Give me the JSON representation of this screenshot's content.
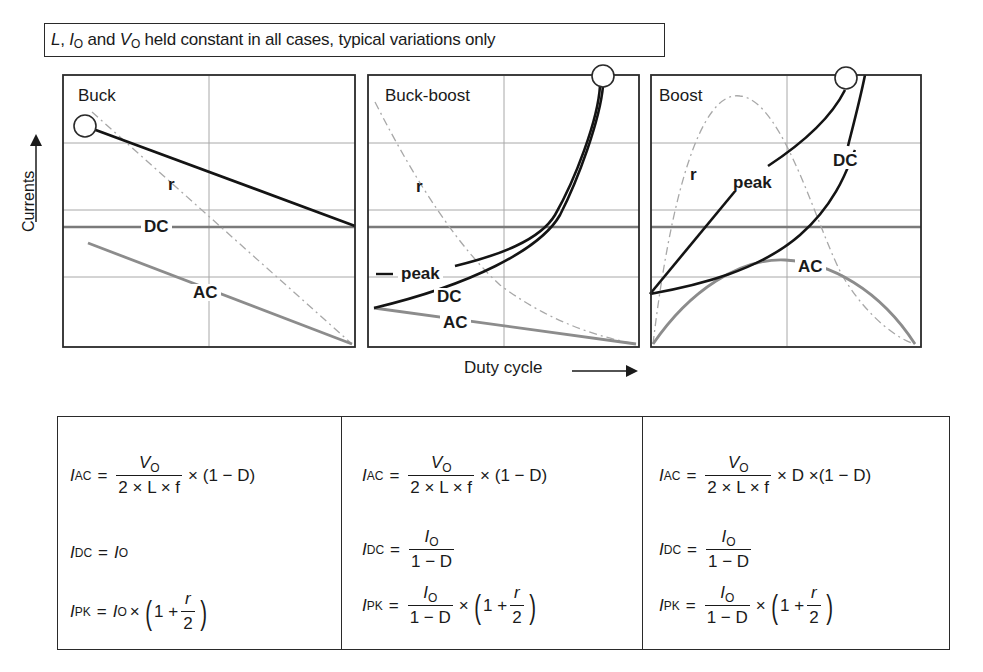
{
  "header": {
    "note_L": "L",
    "note_sep1": ", ",
    "note_I": "I",
    "note_I_sub": "O",
    "note_and": " and ",
    "note_V": "V",
    "note_V_sub": "O",
    "note_rest": " held constant in all cases, typical variations only"
  },
  "axes": {
    "y_label": "Currents",
    "x_label": "Duty cycle",
    "y_arrow_icon": "arrow-up",
    "x_arrow_icon": "arrow-right"
  },
  "panels": [
    {
      "title": "Buck",
      "labels": {
        "r": "r",
        "dc": "DC",
        "ac": "AC"
      }
    },
    {
      "title": "Buck-boost",
      "labels": {
        "r": "r",
        "peak": "peak",
        "dc": "DC",
        "ac": "AC"
      }
    },
    {
      "title": "Boost",
      "labels": {
        "r": "r",
        "peak": "peak",
        "dc": "DC",
        "ac": "AC"
      }
    }
  ],
  "formulas": [
    {
      "converter": "Buck",
      "i_ac": {
        "lhs": "I",
        "lhs_sub": "AC",
        "num": "V",
        "num_sub": "O",
        "den": "2 × L × f",
        "tail": "× (1 − D)"
      },
      "i_dc": {
        "lhs": "I",
        "lhs_sub": "DC",
        "rhs": "I",
        "rhs_sub": "O"
      },
      "i_pk": {
        "lhs": "I",
        "lhs_sub": "PK",
        "rhs": "I",
        "rhs_sub": "O",
        "mult": "×",
        "paren_inner": "1 +",
        "r": "r",
        "two": "2"
      }
    },
    {
      "converter": "Buck-boost",
      "i_ac": {
        "lhs": "I",
        "lhs_sub": "AC",
        "num": "V",
        "num_sub": "O",
        "den": "2 × L × f",
        "tail": "× (1 − D)"
      },
      "i_dc": {
        "lhs": "I",
        "lhs_sub": "DC",
        "num": "I",
        "num_sub": "O",
        "den": "1 − D"
      },
      "i_pk": {
        "lhs": "I",
        "lhs_sub": "PK",
        "num": "I",
        "num_sub": "O",
        "den": "1 − D",
        "mult": "×",
        "paren_inner": "1 +",
        "r": "r",
        "two": "2"
      }
    },
    {
      "converter": "Boost",
      "i_ac": {
        "lhs": "I",
        "lhs_sub": "AC",
        "num": "V",
        "num_sub": "O",
        "den": "2 × L × f",
        "tail": "× D ×(1 − D)"
      },
      "i_dc": {
        "lhs": "I",
        "lhs_sub": "DC",
        "num": "I",
        "num_sub": "O",
        "den": "1 − D"
      },
      "i_pk": {
        "lhs": "I",
        "lhs_sub": "PK",
        "num": "I",
        "num_sub": "O",
        "den": "1 − D",
        "mult": "×",
        "paren_inner": "1 +",
        "r": "r",
        "two": "2"
      }
    }
  ],
  "colors": {
    "frame": "#2a2a2a",
    "grid": "#9a9a9a",
    "dc_reference": "#7a7a7a",
    "peak_dc_curve": "#141414",
    "ac_curve": "#8c8c8c",
    "r_curve": "#a8a8a8"
  }
}
